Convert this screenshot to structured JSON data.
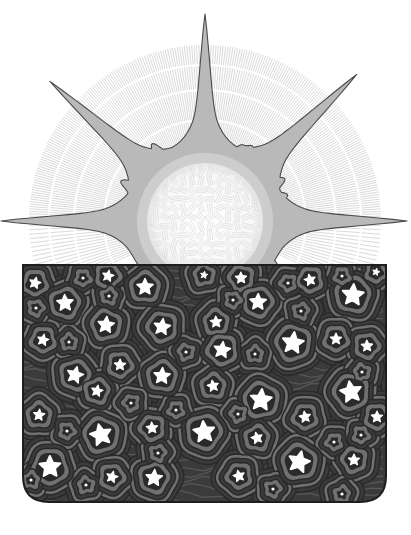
{
  "illustration": {
    "title": "Rising sun over a starry night box",
    "canvas": {
      "width": 411,
      "height": 535,
      "background": "#ffffff"
    },
    "sun": {
      "center": [
        205,
        221
      ],
      "disc_radius": 58,
      "halo_radius": 176,
      "halo_line_count": 220,
      "halo_bands": [
        70,
        100,
        130,
        155,
        176
      ],
      "colors": {
        "disc": "#fbfbfb",
        "disc_hatch": "#d9d9d9",
        "corona": "#b9b9b9",
        "corona_inner": "#cfcfcf",
        "outline": "#4a4a4a",
        "halo_line": "#b5b5b5"
      },
      "rays": [
        {
          "angle": 180,
          "tip": [
            23,
            221
          ]
        },
        {
          "angle": 222,
          "tip": [
            75,
            87
          ]
        },
        {
          "angle": 270,
          "tip": [
            203,
            36
          ]
        },
        {
          "angle": 316,
          "tip": [
            335,
            84
          ]
        },
        {
          "angle": 0,
          "tip": [
            385,
            219
          ]
        }
      ]
    },
    "night_box": {
      "x": 23,
      "y": 265,
      "width": 363,
      "height": 237,
      "corner_radius": 26,
      "colors": {
        "fill": "#3b3b3b",
        "ring": "#707070",
        "ring_dark": "#2a2a2a",
        "border": "#1e1e1e",
        "star": "#ffffff"
      },
      "stars": [
        {
          "x": 35,
          "y": 283,
          "size": "small"
        },
        {
          "x": 108,
          "y": 276,
          "size": "small"
        },
        {
          "x": 65,
          "y": 303,
          "size": "medium"
        },
        {
          "x": 145,
          "y": 287,
          "size": "medium"
        },
        {
          "x": 106,
          "y": 325,
          "size": "medium"
        },
        {
          "x": 162,
          "y": 327,
          "size": "medium"
        },
        {
          "x": 43,
          "y": 340,
          "size": "small"
        },
        {
          "x": 120,
          "y": 365,
          "size": "small"
        },
        {
          "x": 75,
          "y": 375,
          "size": "medium"
        },
        {
          "x": 162,
          "y": 376,
          "size": "medium"
        },
        {
          "x": 204,
          "y": 275,
          "size": "tiny"
        },
        {
          "x": 241,
          "y": 278,
          "size": "small"
        },
        {
          "x": 310,
          "y": 280,
          "size": "small"
        },
        {
          "x": 376,
          "y": 272,
          "size": "tiny"
        },
        {
          "x": 258,
          "y": 302,
          "size": "medium"
        },
        {
          "x": 353,
          "y": 295,
          "size": "large"
        },
        {
          "x": 216,
          "y": 322,
          "size": "small"
        },
        {
          "x": 293,
          "y": 343,
          "size": "large"
        },
        {
          "x": 222,
          "y": 350,
          "size": "medium"
        },
        {
          "x": 336,
          "y": 339,
          "size": "small"
        },
        {
          "x": 367,
          "y": 346,
          "size": "small"
        },
        {
          "x": 97,
          "y": 391,
          "size": "small"
        },
        {
          "x": 39,
          "y": 415,
          "size": "small"
        },
        {
          "x": 101,
          "y": 435,
          "size": "large"
        },
        {
          "x": 152,
          "y": 428,
          "size": "small"
        },
        {
          "x": 50,
          "y": 467,
          "size": "large"
        },
        {
          "x": 112,
          "y": 477,
          "size": "small"
        },
        {
          "x": 154,
          "y": 478,
          "size": "medium"
        },
        {
          "x": 213,
          "y": 386,
          "size": "small"
        },
        {
          "x": 261,
          "y": 400,
          "size": "large"
        },
        {
          "x": 351,
          "y": 392,
          "size": "large"
        },
        {
          "x": 305,
          "y": 417,
          "size": "small"
        },
        {
          "x": 377,
          "y": 417,
          "size": "small"
        },
        {
          "x": 204,
          "y": 432,
          "size": "large"
        },
        {
          "x": 257,
          "y": 438,
          "size": "small"
        },
        {
          "x": 299,
          "y": 462,
          "size": "large"
        },
        {
          "x": 354,
          "y": 460,
          "size": "small"
        },
        {
          "x": 239,
          "y": 476,
          "size": "small"
        }
      ],
      "dots": [
        [
          83,
          278
        ],
        [
          36,
          308
        ],
        [
          109,
          296
        ],
        [
          69,
          342
        ],
        [
          186,
          352
        ],
        [
          288,
          283
        ],
        [
          342,
          276
        ],
        [
          233,
          300
        ],
        [
          301,
          311
        ],
        [
          255,
          354
        ],
        [
          362,
          372
        ],
        [
          131,
          403
        ],
        [
          176,
          410
        ],
        [
          67,
          431
        ],
        [
          158,
          453
        ],
        [
          31,
          480
        ],
        [
          86,
          485
        ],
        [
          238,
          414
        ],
        [
          334,
          442
        ],
        [
          361,
          435
        ],
        [
          273,
          489
        ],
        [
          342,
          494
        ]
      ]
    }
  }
}
